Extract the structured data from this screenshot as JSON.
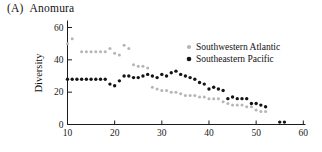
{
  "figure": {
    "panel_label": "(A)",
    "title": "Anomura",
    "ylabel": "Diversity"
  },
  "legend": {
    "items": [
      {
        "label": "Southwestern Atlantic",
        "color": "#b5b5b5"
      },
      {
        "label": "Southeastern Pacific",
        "color": "#141414"
      }
    ]
  },
  "chart_data": {
    "type": "scatter",
    "xlabel": "",
    "ylabel": "Diversity",
    "xlim": [
      10,
      60
    ],
    "ylim": [
      0,
      60
    ],
    "x_ticks": [
      10,
      20,
      30,
      40,
      50,
      60
    ],
    "y_ticks": [
      0,
      20,
      40,
      60
    ],
    "grid": false,
    "legend_position": "top-right",
    "series": [
      {
        "name": "Southwestern Atlantic",
        "color": "#b5b5b5",
        "points": [
          [
            10,
            50
          ],
          [
            11,
            53
          ],
          [
            13,
            45
          ],
          [
            14,
            45
          ],
          [
            15,
            45
          ],
          [
            16,
            45
          ],
          [
            17,
            45
          ],
          [
            18,
            45
          ],
          [
            19,
            47
          ],
          [
            20,
            44
          ],
          [
            21,
            43
          ],
          [
            22,
            49
          ],
          [
            23,
            47
          ],
          [
            24,
            37
          ],
          [
            25,
            36
          ],
          [
            26,
            36
          ],
          [
            27,
            35
          ],
          [
            28,
            23
          ],
          [
            29,
            22
          ],
          [
            30,
            21
          ],
          [
            31,
            21
          ],
          [
            32,
            20
          ],
          [
            33,
            20
          ],
          [
            34,
            19
          ],
          [
            35,
            18
          ],
          [
            36,
            18
          ],
          [
            37,
            18
          ],
          [
            38,
            17
          ],
          [
            39,
            17
          ],
          [
            40,
            16
          ],
          [
            41,
            16
          ],
          [
            42,
            16
          ],
          [
            43,
            14
          ],
          [
            44,
            13
          ],
          [
            45,
            12
          ],
          [
            46,
            12
          ],
          [
            47,
            12
          ],
          [
            48,
            11
          ],
          [
            49,
            11
          ],
          [
            50,
            9
          ],
          [
            51,
            8
          ],
          [
            52,
            8
          ]
        ]
      },
      {
        "name": "Southeastern Pacific",
        "color": "#141414",
        "points": [
          [
            10,
            28
          ],
          [
            11,
            28
          ],
          [
            12,
            28
          ],
          [
            13,
            28
          ],
          [
            14,
            28
          ],
          [
            15,
            28
          ],
          [
            16,
            28
          ],
          [
            17,
            28
          ],
          [
            18,
            28
          ],
          [
            19,
            25
          ],
          [
            20,
            24
          ],
          [
            21,
            27
          ],
          [
            22,
            30
          ],
          [
            23,
            30
          ],
          [
            24,
            29
          ],
          [
            25,
            29
          ],
          [
            26,
            30
          ],
          [
            27,
            31
          ],
          [
            28,
            30
          ],
          [
            29,
            29
          ],
          [
            30,
            31
          ],
          [
            31,
            30
          ],
          [
            32,
            32
          ],
          [
            33,
            33
          ],
          [
            34,
            31
          ],
          [
            35,
            30
          ],
          [
            36,
            29
          ],
          [
            37,
            28
          ],
          [
            38,
            26
          ],
          [
            39,
            25
          ],
          [
            40,
            22
          ],
          [
            41,
            23
          ],
          [
            42,
            22
          ],
          [
            43,
            21
          ],
          [
            44,
            16
          ],
          [
            45,
            17
          ],
          [
            46,
            16
          ],
          [
            47,
            16
          ],
          [
            48,
            16
          ],
          [
            49,
            13
          ],
          [
            50,
            13
          ],
          [
            51,
            12
          ],
          [
            52,
            11
          ],
          [
            55,
            1.5
          ],
          [
            56,
            1.5
          ]
        ]
      }
    ]
  }
}
